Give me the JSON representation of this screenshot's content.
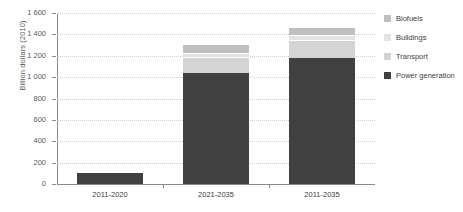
{
  "chart_data": {
    "type": "bar",
    "subtype": "stacked-vertical",
    "title": "",
    "xlabel": "",
    "ylabel": "Billion dollars (2010)",
    "ylim": [
      0,
      1600
    ],
    "ytick_step": 200,
    "yticks": [
      "0",
      "200",
      "400",
      "600",
      "800",
      "1 000",
      "1 200",
      "1 400",
      "1 600"
    ],
    "grid": "horizontal-dotted",
    "legend_position": "right",
    "categories": [
      "2011-2020",
      "2021-2035",
      "2011-2035"
    ],
    "series": [
      {
        "name": "Power generation",
        "color": "#404040",
        "values": [
          100,
          1040,
          1180
        ]
      },
      {
        "name": "Transport",
        "color": "#d4d4d4",
        "values": [
          15,
          150,
          170
        ]
      },
      {
        "name": "Buildings",
        "color": "#e3e3e3",
        "values": [
          0,
          40,
          40
        ]
      },
      {
        "name": "Biofuels",
        "color": "#bfbfbf",
        "values": [
          0,
          80,
          75
        ]
      }
    ],
    "stack_order_bottom_to_top": [
      "Power generation",
      "Transport",
      "Buildings",
      "Biofuels"
    ],
    "legend_order_top_to_bottom": [
      "Biofuels",
      "Buildings",
      "Transport",
      "Power generation"
    ],
    "totals": [
      115,
      1310,
      1465
    ]
  },
  "colors": {
    "axis": "#8a8a8a",
    "grid": "#cfcfcf",
    "text": "#404040",
    "axis_text": "#595959",
    "background": "#ffffff"
  }
}
